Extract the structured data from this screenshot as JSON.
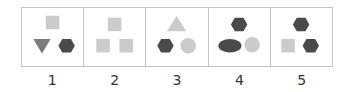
{
  "colors": {
    "light": "#cbcbcb",
    "mid": "#7c7c7c",
    "dark": "#4a4a4a",
    "border": "#c4c4c4"
  },
  "figures": [
    {
      "label": "1",
      "shapes": [
        {
          "type": "square",
          "pos": "top",
          "color": "light"
        },
        {
          "type": "triangle-down",
          "pos": "bottom-left",
          "color": "mid"
        },
        {
          "type": "hexagon",
          "pos": "bottom-right",
          "color": "dark"
        }
      ]
    },
    {
      "label": "2",
      "shapes": [
        {
          "type": "square",
          "pos": "top",
          "color": "light"
        },
        {
          "type": "square",
          "pos": "bottom-left",
          "color": "light"
        },
        {
          "type": "square",
          "pos": "bottom-right",
          "color": "light"
        }
      ]
    },
    {
      "label": "3",
      "shapes": [
        {
          "type": "triangle-up",
          "pos": "top",
          "color": "light"
        },
        {
          "type": "hexagon",
          "pos": "bottom-left",
          "color": "dark"
        },
        {
          "type": "circle",
          "pos": "bottom-right",
          "color": "light"
        }
      ]
    },
    {
      "label": "4",
      "shapes": [
        {
          "type": "hexagon",
          "pos": "top",
          "color": "dark"
        },
        {
          "type": "ellipse",
          "pos": "bottom-left",
          "color": "dark"
        },
        {
          "type": "circle",
          "pos": "bottom-right",
          "color": "light"
        }
      ]
    },
    {
      "label": "5",
      "shapes": [
        {
          "type": "hexagon",
          "pos": "top",
          "color": "dark"
        },
        {
          "type": "square",
          "pos": "bottom-left",
          "color": "light"
        },
        {
          "type": "hexagon",
          "pos": "bottom-right",
          "color": "dark"
        }
      ]
    }
  ]
}
